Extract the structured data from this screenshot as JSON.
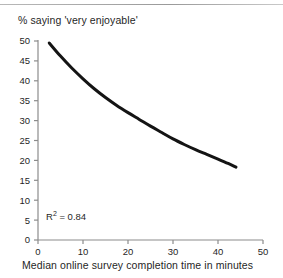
{
  "chart_data": {
    "type": "line",
    "title": "",
    "ylabel": "% saying 'very enjoyable'",
    "xlabel": "Median online survey completion time in minutes",
    "xlim": [
      0,
      50
    ],
    "ylim": [
      0,
      50
    ],
    "xticks": [
      "0",
      "10",
      "20",
      "30",
      "40",
      "50"
    ],
    "xtick_values": [
      0,
      10,
      20,
      30,
      40,
      50
    ],
    "yticks": [
      "0",
      "5",
      "10",
      "15",
      "20",
      "25",
      "30",
      "35",
      "40",
      "45",
      "50"
    ],
    "ytick_values": [
      0,
      5,
      10,
      15,
      20,
      25,
      30,
      35,
      40,
      45,
      50
    ],
    "grid": false,
    "legend": null,
    "annotations": [
      {
        "text": "R2 = 0.84",
        "display": "R",
        "sup": "2",
        "suffix": " = 0.84",
        "x": 5,
        "y": 4
      }
    ],
    "series": [
      {
        "name": "trend",
        "color": "#141414",
        "line_width": 3,
        "x": [
          2.5,
          5,
          7.5,
          10,
          12.5,
          15,
          17.5,
          20,
          22.5,
          25,
          27.5,
          30,
          32.5,
          35,
          37.5,
          40,
          42.5,
          44
        ],
        "y": [
          49.5,
          46.2,
          43.2,
          40.5,
          38.0,
          35.8,
          33.8,
          32.0,
          30.3,
          28.6,
          27.0,
          25.4,
          24.0,
          22.7,
          21.5,
          20.3,
          19.1,
          18.3
        ]
      }
    ]
  },
  "figure": {
    "axis_color": "#8c8c8c",
    "text_color": "#1f1f1f",
    "rule_color": "#a5a5a5",
    "background": "#ffffff"
  }
}
